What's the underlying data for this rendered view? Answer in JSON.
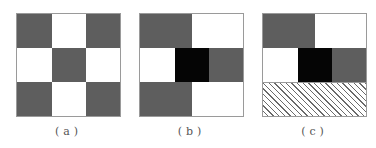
{
  "figure": {
    "panels": [
      {
        "id": "a",
        "caption": "(a)",
        "description": "3x3 checkerboard: gray corners and center, white edges"
      },
      {
        "id": "b",
        "caption": "(b)",
        "description": "Top-left gray, top-right white, middle row white/black/gray, bottom-left gray, bottom-right white"
      },
      {
        "id": "c",
        "caption": "(c)",
        "description": "Top-left gray, top-right white, middle row white/black/gray, bottom row hatched"
      }
    ],
    "colors": {
      "gray": "#5e5e5e",
      "black": "#050505",
      "white": "#ffffff",
      "border": "#9a9a9a"
    }
  }
}
